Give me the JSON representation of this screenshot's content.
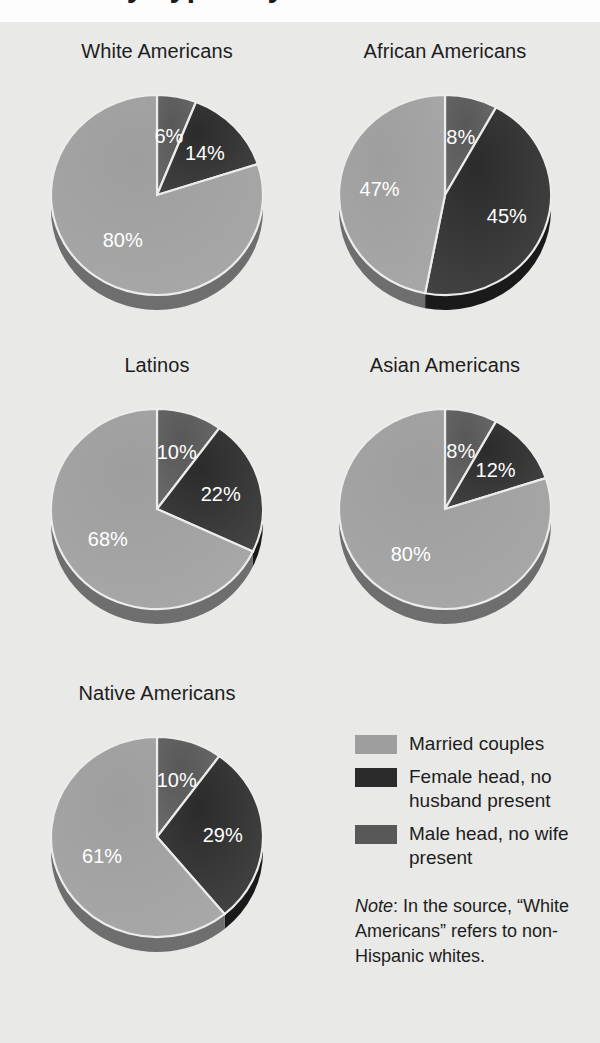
{
  "figure": {
    "cropped_title_fragment": "Family Types by Race",
    "background_color": "#e9e9e7"
  },
  "colors": {
    "married": "#9e9e9e",
    "female_head": "#2b2b2b",
    "male_head": "#585858",
    "rim_married": "#6e6e6e",
    "rim_female_head": "#1a1a1a",
    "rim_male_head": "#3a3a3a",
    "label_text": "#ffffff",
    "title_text": "#1d1d1d"
  },
  "legend": {
    "items": [
      {
        "label": "Married couples",
        "color_key": "married",
        "swatch_name": "legend-swatch-married"
      },
      {
        "label": "Female head, no husband present",
        "color_key": "female_head",
        "swatch_name": "legend-swatch-female-head"
      },
      {
        "label": "Male head, no wife present",
        "color_key": "male_head",
        "swatch_name": "legend-swatch-male-head"
      }
    ]
  },
  "note": {
    "lead": "Note",
    "lead_suffix": ":",
    "text": " In the source, “White Americans” refers to non-Hispanic whites."
  },
  "chart_data": {
    "type": "pie",
    "title": "Family Types by Race",
    "note": "Note: In the source, “White Americans” refers to non-Hispanic whites.",
    "legend_position": "bottom-right",
    "value_unit": "percent",
    "categories": [
      "Married couples",
      "Female head, no husband present",
      "Male head, no wife present"
    ],
    "slice_order_clockwise_from_12oclock": [
      "Male head, no wife present",
      "Female head, no husband present",
      "Married couples"
    ],
    "charts": [
      {
        "title": "White Americans",
        "slices": [
          {
            "category": "Male head, no wife present",
            "value": 6,
            "label": "6%",
            "color_key": "male_head"
          },
          {
            "category": "Female head, no husband present",
            "value": 14,
            "label": "14%",
            "color_key": "female_head"
          },
          {
            "category": "Married couples",
            "value": 80,
            "label": "80%",
            "color_key": "married"
          }
        ]
      },
      {
        "title": "African Americans",
        "slices": [
          {
            "category": "Male head, no wife present",
            "value": 8,
            "label": "8%",
            "color_key": "male_head"
          },
          {
            "category": "Female head, no husband present",
            "value": 45,
            "label": "45%",
            "color_key": "female_head"
          },
          {
            "category": "Married couples",
            "value": 47,
            "label": "47%",
            "color_key": "married"
          }
        ]
      },
      {
        "title": "Latinos",
        "slices": [
          {
            "category": "Male head, no wife present",
            "value": 10,
            "label": "10%",
            "color_key": "male_head"
          },
          {
            "category": "Female head, no husband present",
            "value": 22,
            "label": "22%",
            "color_key": "female_head"
          },
          {
            "category": "Married couples",
            "value": 68,
            "label": "68%",
            "color_key": "married"
          }
        ]
      },
      {
        "title": "Asian Americans",
        "slices": [
          {
            "category": "Male head, no wife present",
            "value": 8,
            "label": "8%",
            "color_key": "male_head"
          },
          {
            "category": "Female head, no husband present",
            "value": 12,
            "label": "12%",
            "color_key": "female_head"
          },
          {
            "category": "Married couples",
            "value": 80,
            "label": "80%",
            "color_key": "married"
          }
        ]
      },
      {
        "title": "Native Americans",
        "slices": [
          {
            "category": "Male head, no wife present",
            "value": 10,
            "label": "10%",
            "color_key": "male_head"
          },
          {
            "category": "Female head, no husband present",
            "value": 29,
            "label": "29%",
            "color_key": "female_head"
          },
          {
            "category": "Married couples",
            "value": 61,
            "label": "61%",
            "color_key": "married"
          }
        ]
      }
    ]
  }
}
